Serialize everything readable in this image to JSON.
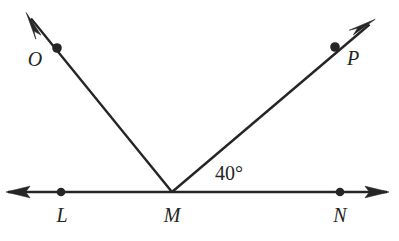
{
  "figure": {
    "type": "geometry-diagram",
    "background_color": "#ffffff",
    "stroke_color": "#252525",
    "width": 399,
    "height": 241
  },
  "points": [
    {
      "id": "L",
      "label": "L",
      "dot_x": 61,
      "dot_y": 192,
      "label_x": 62,
      "label_y": 215
    },
    {
      "id": "M",
      "label": "M",
      "dot_x": 172,
      "dot_y": 192,
      "label_x": 172,
      "label_y": 215
    },
    {
      "id": "N",
      "label": "N",
      "dot_x": 340,
      "dot_y": 192,
      "label_x": 340,
      "label_y": 215
    },
    {
      "id": "O",
      "label": "O",
      "dot_x": 57,
      "dot_y": 48,
      "label_x": 35,
      "label_y": 59
    },
    {
      "id": "P",
      "label": "P",
      "dot_x": 335,
      "dot_y": 47,
      "label_x": 353,
      "label_y": 58
    }
  ],
  "lines": [
    {
      "id": "line-LN",
      "name": "horizontal-line",
      "from_x": 8,
      "from_y": 192,
      "to_x": 387,
      "to_y": 192,
      "arrow_start": true,
      "arrow_end": true
    },
    {
      "id": "ray-MO",
      "name": "ray-to-O",
      "from_x": 172,
      "from_y": 192,
      "to_x": 27,
      "to_y": 14,
      "arrow_start": false,
      "arrow_end": true
    },
    {
      "id": "ray-MP",
      "name": "ray-to-P",
      "from_x": 172,
      "from_y": 192,
      "to_x": 374,
      "to_y": 20,
      "arrow_start": false,
      "arrow_end": true
    }
  ],
  "angles": [
    {
      "id": "angle-NMP",
      "label": "40°",
      "value": 40,
      "unit": "degrees",
      "vertex": "M",
      "rays": [
        "MN",
        "MP"
      ],
      "label_x": 229,
      "label_y": 173
    }
  ]
}
